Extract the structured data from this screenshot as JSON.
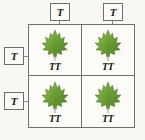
{
  "diagram": {
    "type": "punnett-square",
    "colors": {
      "background": "#f8f7f3",
      "cell_background": "#fcfbf8",
      "border": "#6e6e6e",
      "text": "#1b1b1b",
      "leaf_dark_green": "#4f7d24",
      "leaf_mid_green": "#6fa038",
      "leaf_light_green": "#93c05c",
      "leaf_stem": "#7a9a4a"
    },
    "parents": {
      "top": {
        "label_role": "father-alleles",
        "alleles": [
          {
            "id": "allele-top-left",
            "value": "T"
          },
          {
            "id": "allele-top-right",
            "value": "T"
          }
        ]
      },
      "left": {
        "label_role": "mother-alleles",
        "alleles": [
          {
            "id": "allele-left-top",
            "value": "T"
          },
          {
            "id": "allele-left-bot",
            "value": "T"
          }
        ]
      }
    },
    "grid": {
      "rows": 2,
      "columns": 2,
      "cells": [
        {
          "id": "cell-1-1",
          "genotype": "TT",
          "icon": "leaf-icon",
          "phenotype": "tall-plant"
        },
        {
          "id": "cell-1-2",
          "genotype": "TT",
          "icon": "leaf-icon",
          "phenotype": "tall-plant"
        },
        {
          "id": "cell-2-1",
          "genotype": "TT",
          "icon": "leaf-icon",
          "phenotype": "tall-plant"
        },
        {
          "id": "cell-2-2",
          "genotype": "TT",
          "icon": "leaf-icon",
          "phenotype": "tall-plant"
        }
      ]
    }
  }
}
